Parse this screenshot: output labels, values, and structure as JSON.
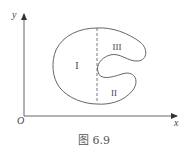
{
  "figure": {
    "caption": "图 6.9",
    "axes": {
      "origin_label": "O",
      "x_label": "x",
      "y_label": "y"
    },
    "regions": [
      {
        "id": "I",
        "label": "I"
      },
      {
        "id": "II",
        "label": "II"
      },
      {
        "id": "III",
        "label": "III"
      }
    ],
    "colors": {
      "stroke": "#555555",
      "text": "#444444"
    }
  }
}
